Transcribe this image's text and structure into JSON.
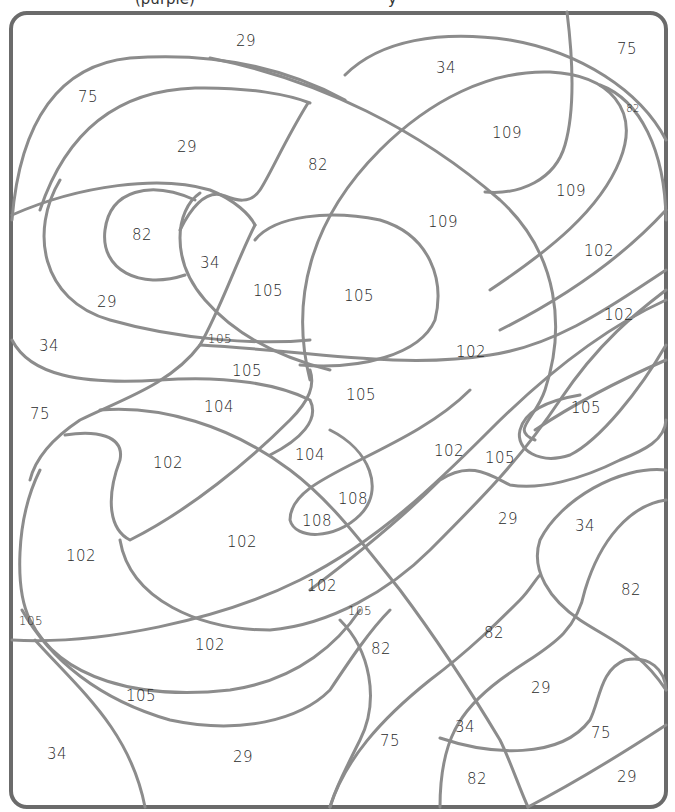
{
  "worksheet": {
    "title_fragment_left": "(purple)",
    "title_fragment_right": "y",
    "stroke_color": "#8c8c8c",
    "frame_color": "#6b6b6b",
    "regions": [
      {
        "label": "29",
        "x": 246,
        "y": 41,
        "size": "md"
      },
      {
        "label": "34",
        "x": 446,
        "y": 68,
        "size": "md"
      },
      {
        "label": "75",
        "x": 627,
        "y": 49,
        "size": "md"
      },
      {
        "label": "82",
        "x": 633,
        "y": 108,
        "size": "xs"
      },
      {
        "label": "75",
        "x": 88,
        "y": 97,
        "size": "md"
      },
      {
        "label": "109",
        "x": 507,
        "y": 133,
        "size": "md"
      },
      {
        "label": "29",
        "x": 187,
        "y": 147,
        "size": "md"
      },
      {
        "label": "82",
        "x": 318,
        "y": 165,
        "size": "md"
      },
      {
        "label": "109",
        "x": 571,
        "y": 191,
        "size": "md"
      },
      {
        "label": "109",
        "x": 443,
        "y": 222,
        "size": "md"
      },
      {
        "label": "82",
        "x": 142,
        "y": 235,
        "size": "md"
      },
      {
        "label": "102",
        "x": 599,
        "y": 251,
        "size": "md"
      },
      {
        "label": "34",
        "x": 210,
        "y": 263,
        "size": "md"
      },
      {
        "label": "105",
        "x": 268,
        "y": 291,
        "size": "md"
      },
      {
        "label": "105",
        "x": 359,
        "y": 296,
        "size": "md"
      },
      {
        "label": "29",
        "x": 107,
        "y": 302,
        "size": "md"
      },
      {
        "label": "102",
        "x": 619,
        "y": 315,
        "size": "md"
      },
      {
        "label": "105",
        "x": 220,
        "y": 339,
        "size": "sm"
      },
      {
        "label": "34",
        "x": 49,
        "y": 346,
        "size": "md"
      },
      {
        "label": "102",
        "x": 471,
        "y": 352,
        "size": "md"
      },
      {
        "label": "105",
        "x": 247,
        "y": 371,
        "size": "md"
      },
      {
        "label": "105",
        "x": 361,
        "y": 395,
        "size": "md"
      },
      {
        "label": "104",
        "x": 219,
        "y": 407,
        "size": "md"
      },
      {
        "label": "105",
        "x": 586,
        "y": 408,
        "size": "md"
      },
      {
        "label": "75",
        "x": 40,
        "y": 414,
        "size": "md"
      },
      {
        "label": "102",
        "x": 449,
        "y": 451,
        "size": "md"
      },
      {
        "label": "104",
        "x": 310,
        "y": 455,
        "size": "md"
      },
      {
        "label": "105",
        "x": 500,
        "y": 458,
        "size": "md"
      },
      {
        "label": "102",
        "x": 168,
        "y": 463,
        "size": "md"
      },
      {
        "label": "108",
        "x": 353,
        "y": 499,
        "size": "md"
      },
      {
        "label": "108",
        "x": 317,
        "y": 521,
        "size": "md"
      },
      {
        "label": "29",
        "x": 508,
        "y": 519,
        "size": "md"
      },
      {
        "label": "34",
        "x": 585,
        "y": 526,
        "size": "md"
      },
      {
        "label": "102",
        "x": 242,
        "y": 542,
        "size": "md"
      },
      {
        "label": "102",
        "x": 81,
        "y": 556,
        "size": "md"
      },
      {
        "label": "102",
        "x": 322,
        "y": 586,
        "size": "md"
      },
      {
        "label": "82",
        "x": 631,
        "y": 590,
        "size": "md"
      },
      {
        "label": "105",
        "x": 360,
        "y": 611,
        "size": "sm"
      },
      {
        "label": "105",
        "x": 31,
        "y": 621,
        "size": "sm"
      },
      {
        "label": "82",
        "x": 494,
        "y": 633,
        "size": "md"
      },
      {
        "label": "102",
        "x": 210,
        "y": 645,
        "size": "md"
      },
      {
        "label": "82",
        "x": 381,
        "y": 649,
        "size": "md"
      },
      {
        "label": "29",
        "x": 541,
        "y": 688,
        "size": "md"
      },
      {
        "label": "105",
        "x": 141,
        "y": 696,
        "size": "md"
      },
      {
        "label": "34",
        "x": 465,
        "y": 727,
        "size": "md"
      },
      {
        "label": "75",
        "x": 601,
        "y": 733,
        "size": "md"
      },
      {
        "label": "75",
        "x": 390,
        "y": 741,
        "size": "md"
      },
      {
        "label": "34",
        "x": 57,
        "y": 754,
        "size": "md"
      },
      {
        "label": "29",
        "x": 243,
        "y": 757,
        "size": "md"
      },
      {
        "label": "82",
        "x": 477,
        "y": 779,
        "size": "md"
      },
      {
        "label": "29",
        "x": 627,
        "y": 777,
        "size": "md"
      }
    ]
  }
}
